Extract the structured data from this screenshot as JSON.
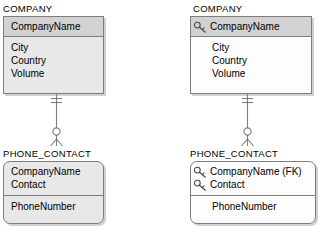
{
  "diagram": {
    "type": "er-diagram",
    "notation": "crow's foot / IDEF1X",
    "colors": {
      "line": "#7d7d7d",
      "pk_fill": "#d2d2d2",
      "body_fill_shaded": "#e8e8e8",
      "body_fill_white": "#fdfdfd",
      "text": "#000000",
      "shadow": "rgba(0,0,0,0.18)"
    },
    "panels": [
      {
        "id": "left",
        "name": "without-key-icons",
        "entities": [
          {
            "id": "company-left",
            "title": "COMPANY",
            "shape": "rectangle",
            "pk_shaded": true,
            "body_white": false,
            "primary_key": [
              {
                "label": "CompanyName",
                "key_icon": false
              }
            ],
            "attributes": [
              {
                "label": "City",
                "key_icon": false
              },
              {
                "label": "Country",
                "key_icon": false
              },
              {
                "label": "Volume",
                "key_icon": false
              }
            ]
          },
          {
            "id": "phone-contact-left",
            "title": "PHONE_CONTACT",
            "shape": "rounded-rectangle",
            "pk_shaded": false,
            "body_white": false,
            "primary_key": [
              {
                "label": "CompanyName",
                "key_icon": false
              },
              {
                "label": "Contact",
                "key_icon": false
              }
            ],
            "attributes": [
              {
                "label": "PhoneNumber",
                "key_icon": false
              }
            ]
          }
        ],
        "relationship": {
          "parent": "COMPANY",
          "child": "PHONE_CONTACT",
          "parent_cardinality": "one-and-only-one",
          "child_cardinality": "zero-or-more",
          "line_style": "solid"
        }
      },
      {
        "id": "right",
        "name": "with-key-icons",
        "entities": [
          {
            "id": "company-right",
            "title": "COMPANY",
            "shape": "rectangle",
            "pk_shaded": true,
            "body_white": true,
            "primary_key": [
              {
                "label": "CompanyName",
                "key_icon": true
              }
            ],
            "attributes": [
              {
                "label": "City",
                "key_icon": false
              },
              {
                "label": "Country",
                "key_icon": false
              },
              {
                "label": "Volume",
                "key_icon": false
              }
            ]
          },
          {
            "id": "phone-contact-right",
            "title": "PHONE_CONTACT",
            "shape": "rounded-rectangle",
            "pk_shaded": false,
            "body_white": true,
            "primary_key": [
              {
                "label": "CompanyName (FK)",
                "key_icon": true
              },
              {
                "label": "Contact",
                "key_icon": true
              }
            ],
            "attributes": [
              {
                "label": "PhoneNumber",
                "key_icon": false
              }
            ]
          }
        ],
        "relationship": {
          "parent": "COMPANY",
          "child": "PHONE_CONTACT",
          "parent_cardinality": "one-and-only-one",
          "child_cardinality": "zero-or-more",
          "line_style": "solid"
        }
      }
    ],
    "icons": {
      "key": "key-icon"
    }
  }
}
